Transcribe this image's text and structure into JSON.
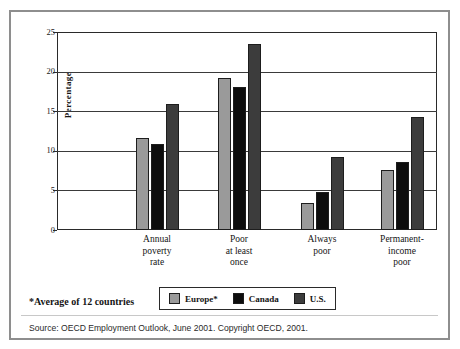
{
  "chart_data": {
    "type": "bar",
    "title": "",
    "subtitle": "",
    "xlabel": "",
    "ylabel": "Percentage",
    "ylim": [
      0,
      25
    ],
    "yticks": [
      0,
      5,
      10,
      15,
      20,
      25
    ],
    "ytick_labels": [
      "0",
      "5",
      "10",
      "15",
      "20",
      "25"
    ],
    "grid": true,
    "legend_position": "bottom-center",
    "categories": [
      "Annual\npoverty\nrate",
      "Poor\nat least\nonce",
      "Always\npoor",
      "Permanent-\nincome\npoor"
    ],
    "category_lines": [
      [
        "Annual",
        "poverty",
        "rate"
      ],
      [
        "Poor",
        "at least",
        "once"
      ],
      [
        "Always",
        "poor"
      ],
      [
        "Permanent-",
        "income",
        "poor"
      ]
    ],
    "series": [
      {
        "name": "Europe*",
        "color": "#9a9a9a",
        "values": [
          11.6,
          19.2,
          3.4,
          7.6
        ]
      },
      {
        "name": "Canada",
        "color": "#0d0d0d",
        "values": [
          10.8,
          18.0,
          4.8,
          8.6
        ]
      },
      {
        "name": "U.S.",
        "color": "#3c3c3c",
        "values": [
          15.9,
          23.5,
          9.2,
          14.3
        ]
      }
    ],
    "footnote": "*Average of 12 countries",
    "source": "Source: OECD Employment Outlook, June 2001. Copyright OECD, 2001."
  },
  "legend": {
    "items": [
      {
        "label": "Europe*",
        "color": "#9a9a9a"
      },
      {
        "label": "Canada",
        "color": "#0d0d0d"
      },
      {
        "label": "U.S.",
        "color": "#3c3c3c"
      }
    ]
  },
  "colors": {
    "europe": "#9a9a9a",
    "canada": "#0d0d0d",
    "us": "#3c3c3c",
    "frame": "#8e8e8e",
    "axis": "#2a2a2a",
    "background": "#ffffff"
  }
}
